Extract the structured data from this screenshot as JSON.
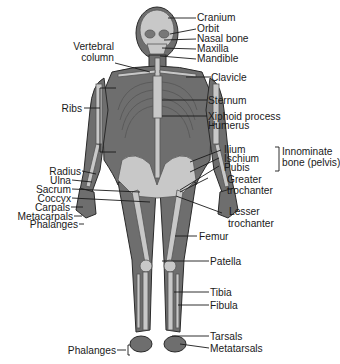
{
  "figure": {
    "colors": {
      "body": "#6e6e6e",
      "bone": "#c8c8c8",
      "outline": "#2a2a2a",
      "text": "#1a1a1a",
      "line": "#1a1a1a"
    },
    "labels_right": {
      "cranium": "Cranium",
      "orbit": "Orbit",
      "nasal_bone": "Nasal bone",
      "maxilla": "Maxilla",
      "mandible": "Mandible",
      "clavicle": "Clavicle",
      "sternum": "Sternum",
      "xiphoid_process": "Xiphoid process",
      "humerus": "Humerus",
      "ilium": "Ilium",
      "ischium": "Ischium",
      "pubis": "Pubis",
      "innominate_1": "Innominate",
      "innominate_2": "bone (pelvis)",
      "greater_trochanter_1": "Greater",
      "greater_trochanter_2": "trochanter",
      "lesser_trochanter_1": "Lesser",
      "lesser_trochanter_2": "trochanter",
      "femur": "Femur",
      "patella": "Patella",
      "tibia": "Tibia",
      "fibula": "Fibula",
      "tarsals": "Tarsals",
      "metatarsals": "Metatarsals"
    },
    "labels_left": {
      "vertebral_column_1": "Vertebral",
      "vertebral_column_2": "column",
      "ribs": "Ribs",
      "radius": "Radius",
      "ulna": "Ulna",
      "sacrum": "Sacrum",
      "coccyx": "Coccyx",
      "carpals": "Carpals",
      "metacarpals": "Metacarpals",
      "phalanges_hand": "Phalanges",
      "phalanges_foot": "Phalanges"
    }
  }
}
